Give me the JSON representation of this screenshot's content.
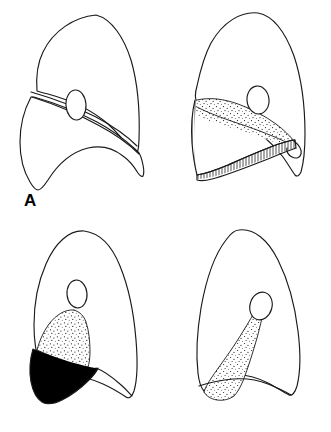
{
  "figure": {
    "background_color": "#ffffff",
    "ink_color": "#1a1a1a",
    "solid_fill_color": "#000000",
    "panel_count": 4,
    "layout": "2x2 grid",
    "panels": [
      {
        "id": "A",
        "label": "A",
        "position": "top-left",
        "description": "Lateral lung outline with open oblique fissure and hilum",
        "shading": "none",
        "features": [
          "lung-outline",
          "oblique-fissure",
          "hilum-oval"
        ]
      },
      {
        "id": "B",
        "label": "B",
        "position": "top-right",
        "description": "Lung with vertically hatched lower lobe and stippled collapsed segment",
        "shading": "vertical-hatch-and-stipple",
        "features": [
          "lung-outline",
          "hatched-region",
          "stippled-region",
          "hilum-oval"
        ]
      },
      {
        "id": "C",
        "label": "C",
        "position": "bottom-left",
        "description": "Lung with solid black collapsed lobe and stippled region above",
        "shading": "solid-black-and-stipple",
        "features": [
          "lung-outline",
          "solid-black-region",
          "stippled-region",
          "hilum-oval"
        ]
      },
      {
        "id": "D",
        "label": "D",
        "position": "bottom-right",
        "description": "Lung with stippled wedge extending from hilum to base",
        "shading": "stipple",
        "features": [
          "lung-outline",
          "stippled-wedge",
          "hilum-oval"
        ]
      }
    ]
  }
}
